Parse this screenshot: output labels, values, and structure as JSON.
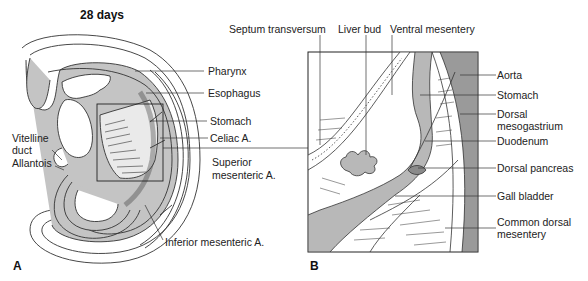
{
  "figure": {
    "panel_a": {
      "letter": "A",
      "title": "28 days",
      "labels": {
        "pharynx": "Pharynx",
        "esophagus": "Esophagus",
        "stomach": "Stomach",
        "celiac": "Celiac A.",
        "sup_mes_1": "Superior",
        "sup_mes_2": "mesenteric A.",
        "inf_mes": "Inferior mesenteric A.",
        "vitelline_1": "Vitelline",
        "vitelline_2": "duct",
        "allantois": "Allantois"
      }
    },
    "panel_b": {
      "letter": "B",
      "top_labels": {
        "septum": "Septum transversum",
        "liver_bud": "Liver bud",
        "ventral_mesentery": "Ventral mesentery"
      },
      "right_labels": {
        "aorta": "Aorta",
        "stomach": "Stomach",
        "dorsal_meso_1": "Dorsal",
        "dorsal_meso_2": "mesogastrium",
        "duodenum": "Duodenum",
        "dorsal_pancreas": "Dorsal pancreas",
        "gall_bladder": "Gall bladder",
        "common_dorsal_1": "Common dorsal",
        "common_dorsal_2": "mesentery"
      }
    },
    "colors": {
      "line": "#333333",
      "fill_gray": "#b8b8b8",
      "fill_dark": "#8a8a8a",
      "background": "#ffffff"
    }
  }
}
